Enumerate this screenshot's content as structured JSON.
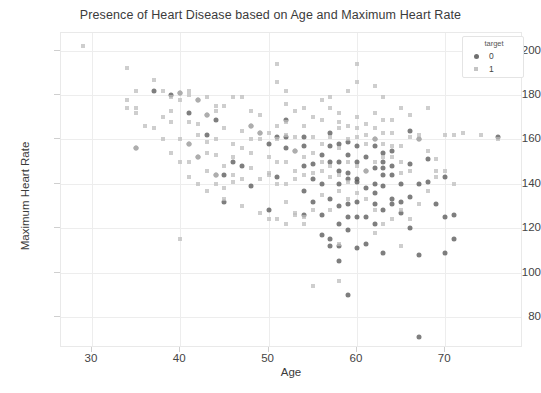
{
  "chart_data": {
    "type": "scatter",
    "title": "Presence of Heart Disease based on Age and Maximum Heart Rate",
    "xlabel": "Age",
    "ylabel": "Maximum Heart Rate",
    "xlim": [
      26.5,
      78.8
    ],
    "ylim": [
      66,
      208
    ],
    "xticks": [
      30,
      40,
      50,
      60,
      70
    ],
    "yticks": [
      80,
      100,
      120,
      140,
      160,
      180,
      200
    ],
    "grid": true,
    "legend": {
      "title": "target",
      "position": "upper right",
      "entries": [
        {
          "label": "0",
          "marker": "circle",
          "color": "#5a5a5a"
        },
        {
          "label": "1",
          "marker": "x",
          "color": "#bdbdbd"
        }
      ]
    },
    "series": [
      {
        "name": "0",
        "marker": "circle",
        "color": "#5a5a5a",
        "points": [
          [
            35,
            156
          ],
          [
            37,
            182
          ],
          [
            39,
            180
          ],
          [
            40,
            181
          ],
          [
            41,
            172
          ],
          [
            41,
            158
          ],
          [
            42,
            178
          ],
          [
            42,
            152
          ],
          [
            43,
            171
          ],
          [
            43,
            162
          ],
          [
            44,
            169
          ],
          [
            44,
            144
          ],
          [
            45,
            144
          ],
          [
            45,
            132
          ],
          [
            46,
            150
          ],
          [
            47,
            148
          ],
          [
            48,
            166
          ],
          [
            48,
            139
          ],
          [
            49,
            163
          ],
          [
            50,
            158
          ],
          [
            50,
            128
          ],
          [
            51,
            161
          ],
          [
            51,
            143
          ],
          [
            52,
            169
          ],
          [
            52,
            161
          ],
          [
            52,
            156
          ],
          [
            53,
            155
          ],
          [
            54,
            161
          ],
          [
            54,
            157
          ],
          [
            54,
            137
          ],
          [
            54,
            126
          ],
          [
            55,
            142
          ],
          [
            56,
            153
          ],
          [
            56,
            140
          ],
          [
            56,
            117
          ],
          [
            57,
            163
          ],
          [
            57,
            150
          ],
          [
            57,
            133
          ],
          [
            57,
            115
          ],
          [
            57,
            112
          ],
          [
            58,
            146
          ],
          [
            58,
            140
          ],
          [
            58,
            130
          ],
          [
            58,
            122
          ],
          [
            58,
            112
          ],
          [
            58,
            105
          ],
          [
            59,
            159
          ],
          [
            59,
            145
          ],
          [
            59,
            142
          ],
          [
            59,
            131
          ],
          [
            59,
            125
          ],
          [
            59,
            119
          ],
          [
            59,
            90
          ],
          [
            60,
            157
          ],
          [
            60,
            141
          ],
          [
            60,
            132
          ],
          [
            60,
            125
          ],
          [
            60,
            111
          ],
          [
            61,
            146
          ],
          [
            61,
            125
          ],
          [
            61,
            113
          ],
          [
            62,
            160
          ],
          [
            62,
            157
          ],
          [
            62,
            140
          ],
          [
            62,
            131
          ],
          [
            62,
            122
          ],
          [
            63,
            154
          ],
          [
            63,
            147
          ],
          [
            63,
            144
          ],
          [
            63,
            128
          ],
          [
            63,
            109
          ],
          [
            64,
            144
          ],
          [
            64,
            133
          ],
          [
            64,
            131
          ],
          [
            65,
            132
          ],
          [
            65,
            127
          ],
          [
            66,
            164
          ],
          [
            66,
            149
          ],
          [
            66,
            120
          ],
          [
            67,
            160
          ],
          [
            67,
            140
          ],
          [
            67,
            108
          ],
          [
            67,
            71
          ],
          [
            68,
            151
          ],
          [
            68,
            141
          ],
          [
            69,
            131
          ],
          [
            70,
            143
          ],
          [
            70,
            125
          ],
          [
            70,
            109
          ],
          [
            71,
            126
          ],
          [
            71,
            115
          ],
          [
            76,
            161
          ],
          [
            55,
            132
          ],
          [
            56,
            126
          ],
          [
            60,
            142
          ],
          [
            61,
            138
          ],
          [
            62,
            136
          ],
          [
            63,
            150
          ],
          [
            64,
            155
          ],
          [
            65,
            140
          ],
          [
            58,
            150
          ],
          [
            59,
            153
          ],
          [
            60,
            150
          ],
          [
            61,
            152
          ],
          [
            57,
            157
          ],
          [
            58,
            158
          ],
          [
            62,
            147
          ],
          [
            63,
            139
          ],
          [
            64,
            148
          ],
          [
            66,
            134
          ],
          [
            54,
            148
          ],
          [
            55,
            149
          ]
        ]
      },
      {
        "name": "1",
        "marker": "x",
        "color": "#bdbdbd",
        "points": [
          [
            29,
            202
          ],
          [
            34,
            192
          ],
          [
            34,
            178
          ],
          [
            34,
            174
          ],
          [
            35,
            182
          ],
          [
            35,
            156
          ],
          [
            35,
            174
          ],
          [
            37,
            187
          ],
          [
            38,
            182
          ],
          [
            39,
            179
          ],
          [
            39,
            173
          ],
          [
            40,
            178
          ],
          [
            40,
            181
          ],
          [
            41,
            180
          ],
          [
            41,
            168
          ],
          [
            41,
            182
          ],
          [
            41,
            158
          ],
          [
            42,
            178
          ],
          [
            42,
            162
          ],
          [
            43,
            179
          ],
          [
            43,
            171
          ],
          [
            43,
            159
          ],
          [
            44,
            175
          ],
          [
            44,
            173
          ],
          [
            44,
            153
          ],
          [
            44,
            144
          ],
          [
            45,
            175
          ],
          [
            45,
            165
          ],
          [
            46,
            179
          ],
          [
            46,
            144
          ],
          [
            47,
            179
          ],
          [
            47,
            164
          ],
          [
            48,
            173
          ],
          [
            48,
            166
          ],
          [
            49,
            171
          ],
          [
            49,
            163
          ],
          [
            50,
            163
          ],
          [
            51,
            186
          ],
          [
            51,
            194
          ],
          [
            51,
            166
          ],
          [
            51,
            160
          ],
          [
            52,
            176
          ],
          [
            52,
            182
          ],
          [
            52,
            162
          ],
          [
            52,
            168
          ],
          [
            53,
            173
          ],
          [
            53,
            155
          ],
          [
            53,
            161
          ],
          [
            54,
            166
          ],
          [
            54,
            174
          ],
          [
            55,
            161
          ],
          [
            55,
            170
          ],
          [
            56,
            178
          ],
          [
            56,
            169
          ],
          [
            57,
            179
          ],
          [
            57,
            174
          ],
          [
            58,
            165
          ],
          [
            58,
            172
          ],
          [
            59,
            160
          ],
          [
            59,
            182
          ],
          [
            60,
            186
          ],
          [
            60,
            194
          ],
          [
            60,
            170
          ],
          [
            61,
            162
          ],
          [
            62,
            184
          ],
          [
            62,
            160
          ],
          [
            63,
            179
          ],
          [
            63,
            158
          ],
          [
            64,
            169
          ],
          [
            65,
            174
          ],
          [
            66,
            171
          ],
          [
            67,
            160
          ],
          [
            68,
            174
          ],
          [
            69,
            146
          ],
          [
            70,
            162
          ],
          [
            71,
            162
          ],
          [
            74,
            162
          ],
          [
            76,
            160
          ],
          [
            45,
            148
          ],
          [
            46,
            152
          ],
          [
            47,
            156
          ],
          [
            48,
            154
          ],
          [
            49,
            160
          ],
          [
            50,
            152
          ],
          [
            50,
            145
          ],
          [
            51,
            150
          ],
          [
            52,
            150
          ],
          [
            53,
            146
          ],
          [
            54,
            152
          ],
          [
            55,
            154
          ],
          [
            56,
            150
          ],
          [
            57,
            148
          ],
          [
            58,
            156
          ],
          [
            59,
            150
          ],
          [
            60,
            148
          ],
          [
            61,
            146
          ],
          [
            62,
            150
          ],
          [
            63,
            152
          ],
          [
            64,
            157
          ],
          [
            65,
            150
          ],
          [
            66,
            146
          ],
          [
            35,
            172
          ],
          [
            37,
            165
          ],
          [
            38,
            170
          ],
          [
            39,
            168
          ],
          [
            40,
            160
          ],
          [
            40,
            115
          ],
          [
            42,
            167
          ],
          [
            43,
            154
          ],
          [
            44,
            160
          ],
          [
            46,
            158
          ],
          [
            48,
            160
          ],
          [
            51,
            140
          ],
          [
            52,
            132
          ],
          [
            53,
            127
          ],
          [
            54,
            122
          ],
          [
            55,
            128
          ],
          [
            56,
            135
          ],
          [
            57,
            128
          ],
          [
            58,
            137
          ],
          [
            59,
            133
          ],
          [
            60,
            136
          ],
          [
            61,
            133
          ],
          [
            62,
            128
          ],
          [
            63,
            122
          ],
          [
            64,
            124
          ],
          [
            65,
            128
          ],
          [
            54,
            125
          ],
          [
            53,
            126
          ],
          [
            52,
            122
          ],
          [
            51,
            124
          ],
          [
            50,
            144
          ],
          [
            49,
            142
          ],
          [
            48,
            147
          ],
          [
            47,
            142
          ],
          [
            46,
            141
          ],
          [
            45,
            138
          ],
          [
            44,
            140
          ],
          [
            43,
            146
          ],
          [
            42,
            152
          ],
          [
            41,
            150
          ],
          [
            60,
            161
          ],
          [
            61,
            158
          ],
          [
            62,
            165
          ],
          [
            63,
            163
          ],
          [
            64,
            163
          ],
          [
            65,
            157
          ],
          [
            66,
            161
          ],
          [
            67,
            162
          ],
          [
            68,
            155
          ],
          [
            69,
            151
          ],
          [
            70,
            146
          ],
          [
            71,
            140
          ],
          [
            72,
            163
          ],
          [
            58,
            96
          ],
          [
            55,
            94
          ],
          [
            58,
            113
          ],
          [
            62,
            118
          ],
          [
            65,
            112
          ],
          [
            66,
            124
          ],
          [
            67,
            131
          ],
          [
            68,
            137
          ],
          [
            69,
            143
          ],
          [
            56,
            146
          ],
          [
            57,
            143
          ],
          [
            58,
            144
          ],
          [
            59,
            141
          ],
          [
            36,
            166
          ],
          [
            38,
            160
          ],
          [
            39,
            154
          ],
          [
            40,
            150
          ],
          [
            41,
            143
          ],
          [
            42,
            140
          ],
          [
            43,
            137
          ],
          [
            45,
            133
          ],
          [
            47,
            130
          ],
          [
            49,
            127
          ],
          [
            50,
            124
          ],
          [
            52,
            140
          ],
          [
            53,
            142
          ],
          [
            54,
            144
          ],
          [
            55,
            145
          ],
          [
            56,
            158
          ],
          [
            57,
            161
          ],
          [
            58,
            168
          ],
          [
            59,
            166
          ],
          [
            60,
            165
          ],
          [
            61,
            167
          ],
          [
            62,
            172
          ],
          [
            63,
            169
          ],
          [
            64,
            152
          ],
          [
            65,
            145
          ]
        ]
      }
    ]
  }
}
